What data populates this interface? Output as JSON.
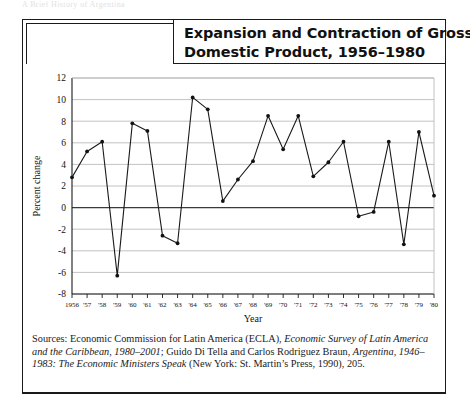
{
  "running_head": "A Brief History of Argentina",
  "figure": {
    "title_line1": "Expansion and Contraction of Gross",
    "title_line2": "Domestic Product, 1956–1980",
    "source_prefix": "Sources: Economic Commission for Latin America (ECLA), ",
    "source_italic1": "Economic Survey of Latin America and the Caribbean, 1980–2001",
    "source_mid": "; Guido Di Tella and Carlos Rodriguez Braun, ",
    "source_italic2": "Argentina, 1946–1983: The Economic Ministers Speak",
    "source_suffix": " (New York: St. Martin’s Press, 1990), 205."
  },
  "chart_data": {
    "type": "line",
    "title": "Expansion and Contraction of Gross Domestic Product, 1956–1980",
    "xlabel": "Year",
    "ylabel": "Percent change",
    "ylim": [
      -8,
      12
    ],
    "ytick_step": 2,
    "yticks": [
      "12",
      "10",
      "8",
      "6",
      "4",
      "2",
      "0",
      "-2",
      "-4",
      "-6",
      "-8"
    ],
    "grid": true,
    "legend": "none",
    "categories": [
      "1956",
      "'57",
      "'58",
      "'59",
      "'60",
      "'61",
      "'62",
      "'63",
      "'64",
      "'65",
      "'66",
      "'67",
      "'68",
      "'69",
      "'70",
      "'71",
      "'72",
      "'73",
      "'74",
      "'75",
      "'76",
      "'77",
      "'78",
      "'79",
      "'80"
    ],
    "series": [
      {
        "name": "Percent change in GDP",
        "values": [
          2.8,
          5.2,
          6.1,
          -6.3,
          7.8,
          7.1,
          -2.6,
          -3.3,
          10.2,
          9.1,
          0.6,
          2.6,
          4.3,
          8.5,
          5.4,
          8.5,
          2.9,
          4.2,
          6.1,
          -0.8,
          -0.4,
          6.1,
          -3.4,
          7.0,
          1.1
        ]
      }
    ]
  }
}
